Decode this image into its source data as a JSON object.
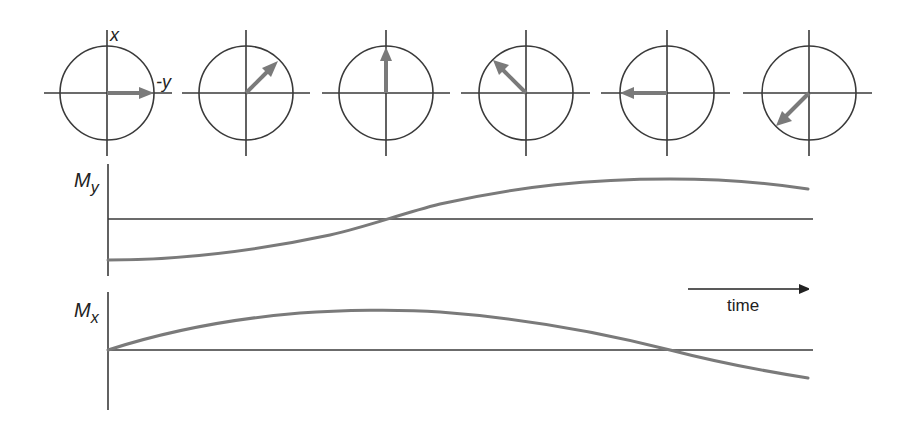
{
  "diagram": {
    "title": "",
    "colors": {
      "line": "#3a3a3a",
      "curve": "#7a7a7a",
      "text": "#222222"
    },
    "rotating_frame": {
      "axis_labels": {
        "vertical": "x",
        "horizontal": "-y"
      },
      "vectors": [
        {
          "index": 0,
          "angle_deg": 0,
          "direction": "+ (toward -y)"
        },
        {
          "index": 1,
          "angle_deg": 45,
          "direction": "up-right"
        },
        {
          "index": 2,
          "angle_deg": 90,
          "direction": "up (toward x)"
        },
        {
          "index": 3,
          "angle_deg": 135,
          "direction": "up-left"
        },
        {
          "index": 4,
          "angle_deg": 180,
          "direction": "left"
        },
        {
          "index": 5,
          "angle_deg": 225,
          "direction": "down-left"
        }
      ]
    },
    "plots": {
      "my": {
        "label_main": "M",
        "label_sub": "y",
        "curve": "negative cosine-like rising through zero at step 2, peak near step 4"
      },
      "mx": {
        "label_main": "M",
        "label_sub": "x",
        "curve": "sine-like starting at zero, peak near step 2, crossing zero near step 4"
      }
    },
    "time_arrow": {
      "label": "time"
    }
  }
}
